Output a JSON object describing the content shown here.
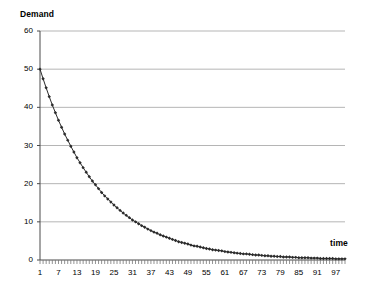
{
  "chart_data": {
    "type": "line",
    "title": "",
    "subtitle": "",
    "ylabel": "Demand",
    "xlabel": "time",
    "ylim": [
      0,
      60
    ],
    "xlim": [
      1,
      100
    ],
    "ytick_labels": [
      "60",
      "50",
      "40",
      "30",
      "20",
      "10",
      "0"
    ],
    "ytick_values": [
      60,
      50,
      40,
      30,
      20,
      10,
      0
    ],
    "xtick_labels": [
      "1",
      "7",
      "13",
      "19",
      "25",
      "31",
      "37",
      "43",
      "49",
      "55",
      "61",
      "67",
      "73",
      "79",
      "85",
      "91",
      "97"
    ],
    "xtick_values": [
      1,
      7,
      13,
      19,
      25,
      31,
      37,
      43,
      49,
      55,
      61,
      67,
      73,
      79,
      85,
      91,
      97
    ],
    "grid": "horizontal",
    "legend": "none",
    "marker": "diamond",
    "series_color": "#2b2b2b",
    "grid_color": "#b5b5b5",
    "series": [
      {
        "name": "Demand",
        "x": [
          1,
          2,
          3,
          4,
          5,
          6,
          7,
          8,
          9,
          10,
          11,
          12,
          13,
          14,
          15,
          16,
          17,
          18,
          19,
          20,
          21,
          22,
          23,
          24,
          25,
          26,
          27,
          28,
          29,
          30,
          31,
          32,
          33,
          34,
          35,
          36,
          37,
          38,
          39,
          40,
          41,
          42,
          43,
          44,
          45,
          46,
          47,
          48,
          49,
          50,
          51,
          52,
          53,
          54,
          55,
          56,
          57,
          58,
          59,
          60,
          61,
          62,
          63,
          64,
          65,
          66,
          67,
          68,
          69,
          70,
          71,
          72,
          73,
          74,
          75,
          76,
          77,
          78,
          79,
          80,
          81,
          82,
          83,
          84,
          85,
          86,
          87,
          88,
          89,
          90,
          91,
          92,
          93,
          94,
          95,
          96,
          97,
          98,
          99,
          100
        ],
        "values": [
          50.0,
          47.5,
          45.1,
          42.8,
          40.6,
          38.6,
          36.6,
          34.8,
          33.0,
          31.4,
          29.8,
          28.3,
          26.8,
          25.5,
          24.2,
          23.0,
          21.8,
          20.7,
          19.7,
          18.7,
          17.7,
          16.8,
          16.0,
          15.2,
          14.4,
          13.7,
          13.0,
          12.3,
          11.7,
          11.1,
          10.5,
          10.0,
          9.5,
          9.0,
          8.6,
          8.1,
          7.7,
          7.3,
          7.0,
          6.6,
          6.3,
          6.0,
          5.7,
          5.4,
          5.1,
          4.8,
          4.6,
          4.4,
          4.2,
          3.9,
          3.7,
          3.6,
          3.4,
          3.2,
          3.0,
          2.9,
          2.7,
          2.6,
          2.5,
          2.4,
          2.2,
          2.1,
          2.0,
          1.9,
          1.8,
          1.7,
          1.6,
          1.6,
          1.5,
          1.4,
          1.3,
          1.3,
          1.2,
          1.1,
          1.1,
          1.0,
          1.0,
          0.9,
          0.9,
          0.8,
          0.8,
          0.8,
          0.7,
          0.7,
          0.6,
          0.6,
          0.6,
          0.6,
          0.5,
          0.5,
          0.5,
          0.4,
          0.4,
          0.4,
          0.4,
          0.4,
          0.3,
          0.3,
          0.3,
          0.3
        ]
      }
    ]
  }
}
